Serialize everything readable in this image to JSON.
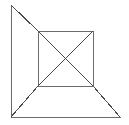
{
  "figure": {
    "canvas": {
      "width": 129,
      "height": 125,
      "background_color": "#ffffff"
    },
    "style": {
      "stroke_color": "#6b6b6b",
      "stroke_color_dark": "#4a4a4a",
      "stroke_width": 1
    },
    "points": {
      "outer_top_apex": {
        "x": 11,
        "y": 5
      },
      "outer_bottom_left": {
        "x": 11,
        "y": 117
      },
      "outer_bottom_right": {
        "x": 120,
        "y": 117
      },
      "square_top_left": {
        "x": 38,
        "y": 31
      },
      "square_top_right": {
        "x": 93,
        "y": 31
      },
      "square_bottom_right": {
        "x": 93,
        "y": 86
      },
      "square_bottom_left": {
        "x": 38,
        "y": 86
      },
      "square_center": {
        "x": 65.5,
        "y": 58.5
      }
    },
    "segments": [
      {
        "name": "outer-left-edge",
        "x1": 11,
        "y1": 5,
        "x2": 11,
        "y2": 117,
        "color": "#6b6b6b"
      },
      {
        "name": "outer-bottom-edge",
        "x1": 11,
        "y1": 117,
        "x2": 120,
        "y2": 117,
        "color": "#6b6b6b"
      },
      {
        "name": "diagonal-apex-to-square-tl",
        "x1": 11,
        "y1": 5,
        "x2": 38,
        "y2": 31,
        "color": "#4a4a4a"
      },
      {
        "name": "diagonal-bl-to-square-bl",
        "x1": 11,
        "y1": 117,
        "x2": 38,
        "y2": 86,
        "color": "#4a4a4a"
      },
      {
        "name": "diagonal-square-br-to-br",
        "x1": 93,
        "y1": 86,
        "x2": 120,
        "y2": 117,
        "color": "#4a4a4a"
      },
      {
        "name": "square-top-edge",
        "x1": 38,
        "y1": 31,
        "x2": 93,
        "y2": 31,
        "color": "#6b6b6b"
      },
      {
        "name": "square-right-edge",
        "x1": 93,
        "y1": 31,
        "x2": 93,
        "y2": 86,
        "color": "#6b6b6b"
      },
      {
        "name": "square-bottom-edge",
        "x1": 38,
        "y1": 86,
        "x2": 93,
        "y2": 86,
        "color": "#6b6b6b"
      },
      {
        "name": "square-left-edge",
        "x1": 38,
        "y1": 31,
        "x2": 38,
        "y2": 86,
        "color": "#6b6b6b"
      },
      {
        "name": "square-diagonal-tl-br",
        "x1": 38,
        "y1": 31,
        "x2": 93,
        "y2": 86,
        "color": "#4a4a4a"
      },
      {
        "name": "square-diagonal-tr-bl",
        "x1": 93,
        "y1": 31,
        "x2": 38,
        "y2": 86,
        "color": "#4a4a4a"
      }
    ]
  }
}
